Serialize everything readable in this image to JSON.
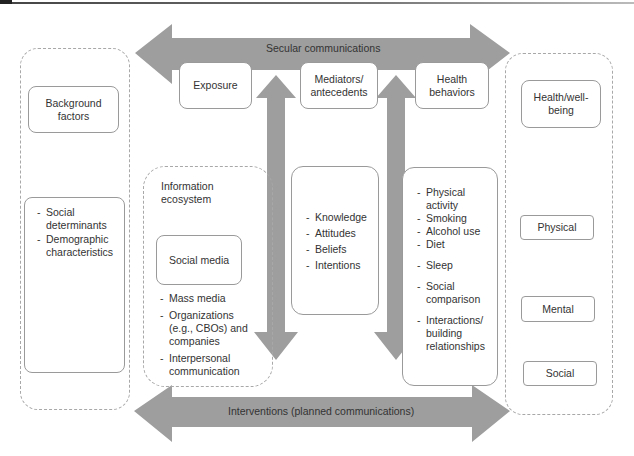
{
  "diagram": {
    "top_arrow": {
      "label": "Secular communications",
      "direction": "bidirectional-horizontal"
    },
    "bottom_arrow": {
      "label": "Interventions (planned communications)",
      "direction": "bidirectional-horizontal"
    },
    "left_panel": {
      "header": "Background factors",
      "items": [
        "Social determinants",
        "Demographic characteristics"
      ]
    },
    "stage_boxes": {
      "exposure": "Exposure",
      "mediators": "Mediators/ antecedents",
      "health_behaviors": "Health behaviors"
    },
    "information_ecosystem": {
      "title": "Information ecosystem",
      "social_media": "Social media",
      "items": [
        "Mass media",
        "Organizations (e.g., CBOs) and companies",
        "Interpersonal communication"
      ]
    },
    "mediators_list": [
      "Knowledge",
      "Attitudes",
      "Beliefs",
      "Intentions"
    ],
    "behaviors_list": [
      "Physical activity",
      "Smoking",
      "Alcohol use",
      "Diet",
      "Sleep",
      "Social comparison",
      "Interactions/ building relationships"
    ],
    "right_panel": {
      "header": "Health/well-being",
      "items": [
        "Physical",
        "Mental",
        "Social"
      ]
    },
    "colors": {
      "arrow_fill": "#9e9e9e",
      "border": "#9a9a9a",
      "dashed_border": "#a8a8a8",
      "text": "#333333"
    }
  }
}
